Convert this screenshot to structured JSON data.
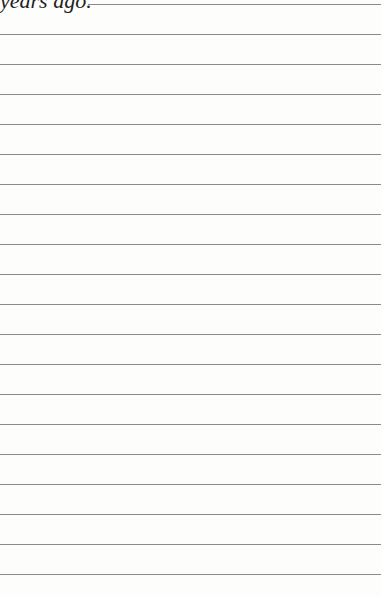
{
  "page": {
    "heading_fragment": "years ago.",
    "first_rule_left": 88,
    "rule_count": 20,
    "first_rule_top": 4,
    "rule_spacing": 30,
    "rule_color": "#8a8a8a",
    "background": "#fdfdfc"
  }
}
